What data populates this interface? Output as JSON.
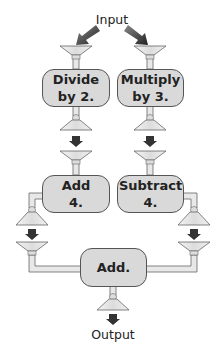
{
  "diagram": {
    "input_label": "Input",
    "output_label": "Output",
    "machines": [
      {
        "id": "divide",
        "line1": "Divide",
        "line2": "by 2."
      },
      {
        "id": "multiply",
        "line1": "Multiply",
        "line2": "by 3."
      },
      {
        "id": "add4",
        "line1": "Add",
        "line2": "4."
      },
      {
        "id": "subtract4",
        "line1": "Subtract",
        "line2": "4."
      },
      {
        "id": "add",
        "line1": "Add.",
        "line2": ""
      }
    ],
    "colors": {
      "box_fill": "#d9d9d9",
      "box_border": "#555555",
      "arrow": "#333333",
      "funnel_fill": "#e6e6e6",
      "pipe": "#bbbbbb"
    }
  }
}
